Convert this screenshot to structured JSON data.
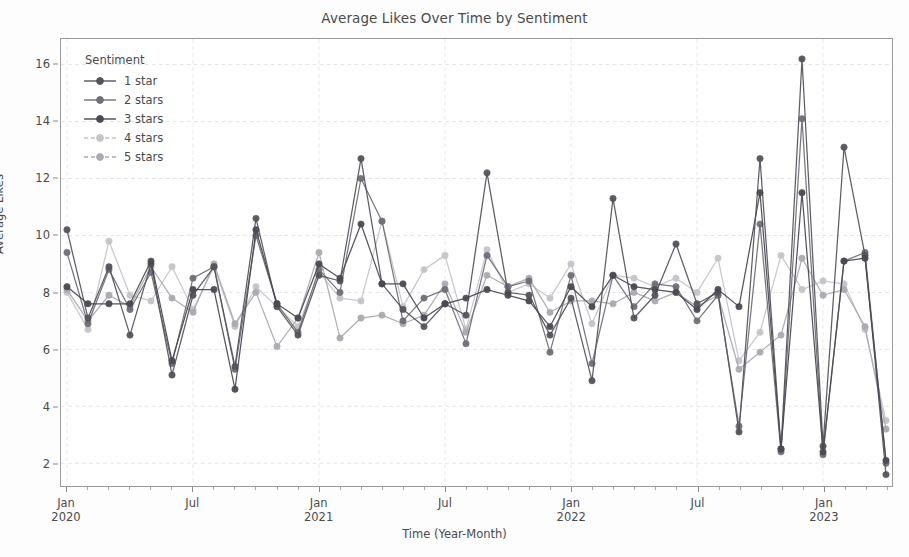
{
  "chart_data": {
    "type": "line",
    "title": "Average Likes Over Time by Sentiment",
    "xlabel": "Time (Year-Month)",
    "ylabel": "Average Likes",
    "ylim": [
      1.2,
      16.9
    ],
    "yticks": [
      2,
      4,
      6,
      8,
      10,
      12,
      14,
      16
    ],
    "grid": true,
    "legend": {
      "title": "Sentiment",
      "position": "upper-left",
      "entries": [
        "1 star",
        "2 stars",
        "3 stars",
        "4 stars",
        "5 stars"
      ]
    },
    "xticks_major": [
      {
        "label": "Jan",
        "year": "2020",
        "index": 0
      },
      {
        "label": "Jul",
        "year": "",
        "index": 6
      },
      {
        "label": "Jan",
        "year": "2021",
        "index": 12
      },
      {
        "label": "Jul",
        "year": "",
        "index": 18
      },
      {
        "label": "Jan",
        "year": "2022",
        "index": 24
      },
      {
        "label": "Jul",
        "year": "",
        "index": 30
      },
      {
        "label": "Jan",
        "year": "2023",
        "index": 36
      }
    ],
    "x": [
      "2020-01",
      "2020-02",
      "2020-03",
      "2020-04",
      "2020-05",
      "2020-06",
      "2020-07",
      "2020-08",
      "2020-09",
      "2020-10",
      "2020-11",
      "2020-12",
      "2021-01",
      "2021-02",
      "2021-03",
      "2021-04",
      "2021-05",
      "2021-06",
      "2021-07",
      "2021-08",
      "2021-09",
      "2021-10",
      "2021-11",
      "2021-12",
      "2022-01",
      "2022-02",
      "2022-03",
      "2022-04",
      "2022-05",
      "2022-06",
      "2022-07",
      "2022-08",
      "2022-09",
      "2022-10",
      "2022-11",
      "2022-12",
      "2023-01",
      "2023-02",
      "2023-03",
      "2023-04"
    ],
    "colors": {
      "1 star": "#54545c",
      "2 stars": "#6f6f78",
      "3 stars": "#4a4a52",
      "4 stars": "#c4c4ca",
      "5 stars": "#aaaab2"
    },
    "series": [
      {
        "name": "1 star",
        "color": "#54545c",
        "values": [
          10.2,
          7.1,
          8.9,
          6.5,
          9.0,
          5.1,
          7.9,
          8.9,
          5.4,
          10.6,
          7.5,
          6.5,
          8.6,
          8.4,
          12.7,
          8.3,
          7.4,
          6.8,
          7.6,
          7.2,
          12.2,
          8.0,
          7.9,
          6.5,
          7.8,
          4.9,
          11.3,
          7.1,
          7.9,
          9.7,
          7.6,
          8.0,
          3.1,
          12.7,
          2.5,
          16.2,
          2.6,
          13.1,
          9.3,
          1.6
        ]
      },
      {
        "name": "2 stars",
        "color": "#6f6f78",
        "values": [
          9.4,
          6.9,
          8.8,
          7.4,
          8.7,
          5.5,
          8.5,
          8.9,
          5.3,
          10.0,
          7.6,
          6.6,
          8.8,
          8.0,
          12.0,
          10.5,
          7.0,
          7.8,
          8.1,
          6.2,
          9.3,
          8.2,
          8.4,
          5.9,
          8.6,
          5.5,
          8.6,
          7.5,
          8.3,
          8.2,
          7.0,
          7.9,
          3.3,
          10.4,
          2.4,
          14.1,
          2.3,
          9.1,
          9.4,
          2.0
        ]
      },
      {
        "name": "3 stars",
        "color": "#4a4a52",
        "values": [
          8.2,
          7.6,
          7.6,
          7.6,
          9.1,
          5.6,
          8.1,
          8.1,
          4.6,
          10.2,
          7.6,
          7.1,
          9.0,
          8.5,
          10.4,
          8.3,
          8.3,
          7.1,
          7.6,
          7.8,
          8.1,
          7.9,
          7.7,
          6.8,
          8.2,
          7.5,
          8.6,
          8.2,
          8.1,
          8.0,
          7.4,
          8.1,
          7.5,
          11.5,
          2.5,
          11.5,
          2.4,
          9.1,
          9.2,
          2.1
        ]
      },
      {
        "name": "4 stars",
        "color": "#c4c4ca",
        "values": [
          8.0,
          6.7,
          9.8,
          7.9,
          7.7,
          8.9,
          7.4,
          8.9,
          6.8,
          8.2,
          7.5,
          6.8,
          8.7,
          7.8,
          7.7,
          10.5,
          7.5,
          8.8,
          9.3,
          6.7,
          9.5,
          8.0,
          8.3,
          7.8,
          9.0,
          6.9,
          8.6,
          8.5,
          8.2,
          8.5,
          8.0,
          9.2,
          5.6,
          6.6,
          9.3,
          8.1,
          8.4,
          8.3,
          6.7,
          3.5
        ]
      },
      {
        "name": "5 stars",
        "color": "#aaaab2",
        "values": [
          8.1,
          7.0,
          7.9,
          7.5,
          8.9,
          7.8,
          7.3,
          9.0,
          6.9,
          8.0,
          6.1,
          7.1,
          9.4,
          6.4,
          7.1,
          7.2,
          6.9,
          7.2,
          8.3,
          6.6,
          8.6,
          8.2,
          8.5,
          7.3,
          7.7,
          7.7,
          7.6,
          8.0,
          7.7,
          8.0,
          7.5,
          7.9,
          5.3,
          5.9,
          6.5,
          9.2,
          7.9,
          8.1,
          6.8,
          3.2
        ]
      }
    ]
  }
}
